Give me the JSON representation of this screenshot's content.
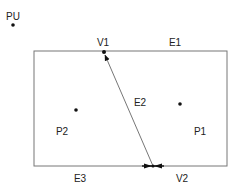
{
  "diagram": {
    "type": "planar-subdivision",
    "colors": {
      "background": "#ffffff",
      "edge": "#777777",
      "ink": "#111111",
      "label": "#222222"
    },
    "outer_point": {
      "label": "PU",
      "x": 13,
      "y": 25
    },
    "rectangle": {
      "x1": 34,
      "y1": 51,
      "x2": 227,
      "y2": 166
    },
    "vertices": [
      {
        "id": "V1",
        "label": "V1",
        "x": 104,
        "y": 52,
        "label_x": 103,
        "label_y": 46
      },
      {
        "id": "V2",
        "label": "V2",
        "x": 153,
        "y": 166,
        "label_x": 182,
        "label_y": 182
      }
    ],
    "edges": [
      {
        "id": "E1",
        "label": "E1",
        "label_x": 175,
        "label_y": 46
      },
      {
        "id": "E2",
        "label": "E2",
        "label_x": 140,
        "label_y": 106,
        "from": "V2",
        "to": "V1"
      },
      {
        "id": "E3",
        "label": "E3",
        "label_x": 80,
        "label_y": 182
      }
    ],
    "faces": [
      {
        "id": "P1",
        "label": "P1",
        "dot_x": 180,
        "dot_y": 104,
        "label_x": 200,
        "label_y": 135
      },
      {
        "id": "P2",
        "label": "P2",
        "dot_x": 76,
        "dot_y": 110,
        "label_x": 62,
        "label_y": 135
      }
    ]
  }
}
